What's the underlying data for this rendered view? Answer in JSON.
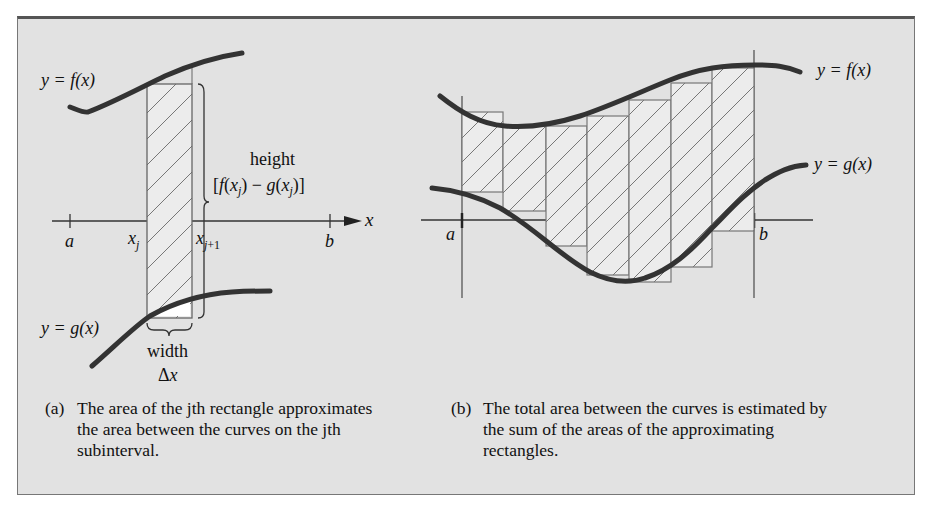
{
  "panel_a": {
    "label_f": "y = f(x)",
    "label_g": "y = g(x)",
    "height_word": "height",
    "height_formula": "[f(xj) − g(xj)]",
    "width_word": "width",
    "width_symbol": "Δx",
    "axis_var": "x",
    "ticks": [
      "a",
      "xj",
      "xj+1",
      "b"
    ],
    "caption_tag": "(a)",
    "caption": "The area of the jth rectangle approximates the area between the curves on the jth subinterval."
  },
  "panel_b": {
    "label_f": "y = f(x)",
    "label_g": "y = g(x)",
    "ticks": [
      "a",
      "b"
    ],
    "rectangle_count": 7,
    "caption_tag": "(b)",
    "caption": "The total area between the curves is estimated by the sum of the areas of the approximating rectangles."
  },
  "colors": {
    "background": "#e2e2e2",
    "curve": "#333333",
    "rect_fill": "#ececec",
    "rect_stroke": "#777777"
  }
}
